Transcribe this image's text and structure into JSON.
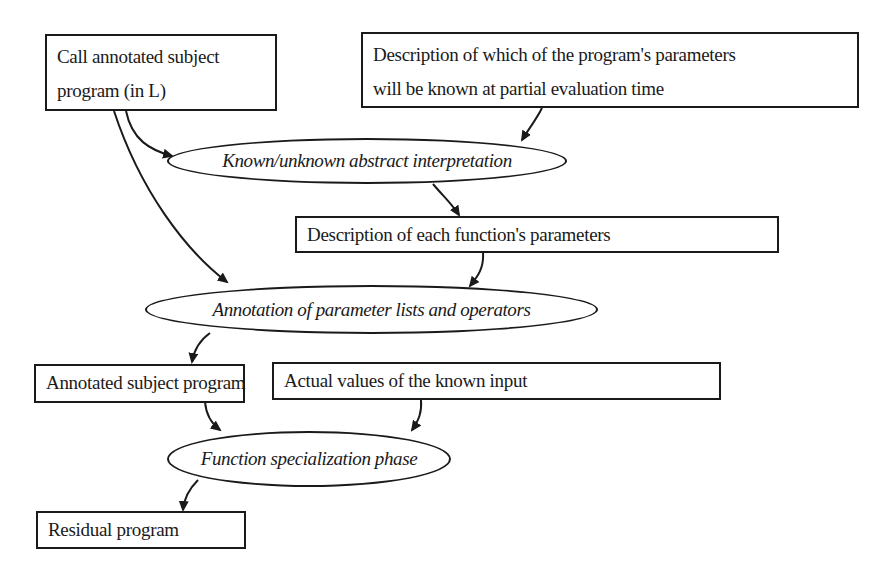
{
  "diagram": {
    "type": "flowchart",
    "nodes": [
      {
        "id": "call_program",
        "shape": "rectangle",
        "lines": [
          "Call annotated subject",
          "program (in L)"
        ]
      },
      {
        "id": "param_description",
        "shape": "rectangle",
        "lines": [
          "Description of which of the program's parameters",
          "will be known at partial evaluation time"
        ]
      },
      {
        "id": "abstract_interp",
        "shape": "ellipse",
        "label": "Known/unknown abstract interpretation"
      },
      {
        "id": "func_params",
        "shape": "rectangle",
        "label": "Description of each function's parameters"
      },
      {
        "id": "annotation",
        "shape": "ellipse",
        "label": "Annotation of parameter lists and operators"
      },
      {
        "id": "annotated_program",
        "shape": "rectangle",
        "label": "Annotated subject program"
      },
      {
        "id": "actual_values",
        "shape": "rectangle",
        "label": "Actual values of the known input"
      },
      {
        "id": "specialization",
        "shape": "ellipse",
        "label": "Function specialization phase"
      },
      {
        "id": "residual",
        "shape": "rectangle",
        "label": "Residual program"
      }
    ],
    "edges": [
      {
        "from": "call_program",
        "to": "abstract_interp"
      },
      {
        "from": "param_description",
        "to": "abstract_interp"
      },
      {
        "from": "abstract_interp",
        "to": "func_params"
      },
      {
        "from": "call_program",
        "to": "annotation"
      },
      {
        "from": "func_params",
        "to": "annotation"
      },
      {
        "from": "annotation",
        "to": "annotated_program"
      },
      {
        "from": "annotated_program",
        "to": "specialization"
      },
      {
        "from": "actual_values",
        "to": "specialization"
      },
      {
        "from": "specialization",
        "to": "residual"
      }
    ],
    "colors": {
      "stroke": "#1a1a1a",
      "background": "#ffffff"
    }
  }
}
